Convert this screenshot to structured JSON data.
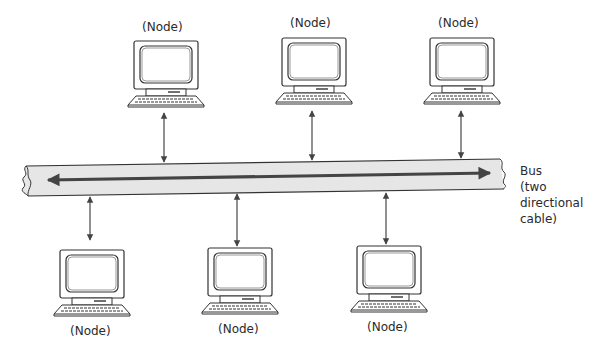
{
  "diagram": {
    "type": "bus-topology",
    "bus": {
      "label_lines": [
        "Bus",
        "(two",
        "directional",
        "cable)"
      ],
      "fill_color": "#e6e6e6",
      "stroke_color": "#333333",
      "arrow_color": "#444444"
    },
    "nodes": [
      {
        "label": "(Node)",
        "position": "top",
        "index": 0
      },
      {
        "label": "(Node)",
        "position": "top",
        "index": 1
      },
      {
        "label": "(Node)",
        "position": "top",
        "index": 2
      },
      {
        "label": "(Node)",
        "position": "bottom",
        "index": 0
      },
      {
        "label": "(Node)",
        "position": "bottom",
        "index": 1
      },
      {
        "label": "(Node)",
        "position": "bottom",
        "index": 2
      }
    ]
  }
}
